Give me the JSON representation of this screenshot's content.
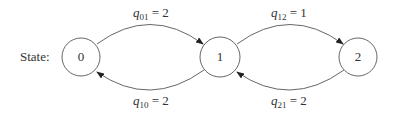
{
  "diagram": {
    "type": "state-transition (Markov chain)",
    "row_label": "State:",
    "states": [
      {
        "id": "0",
        "label": "0"
      },
      {
        "id": "1",
        "label": "1"
      },
      {
        "id": "2",
        "label": "2"
      }
    ],
    "transitions": [
      {
        "from": "0",
        "to": "1",
        "symbol": "q",
        "sub": "01",
        "value": "= 2",
        "position": "top"
      },
      {
        "from": "1",
        "to": "0",
        "symbol": "q",
        "sub": "10",
        "value": "= 2",
        "position": "bottom"
      },
      {
        "from": "1",
        "to": "2",
        "symbol": "q",
        "sub": "12",
        "value": "= 1",
        "position": "top"
      },
      {
        "from": "2",
        "to": "1",
        "symbol": "q",
        "sub": "21",
        "value": "= 2",
        "position": "bottom"
      }
    ],
    "colors": {
      "stroke": "#555555",
      "text": "#333333",
      "background": "#ffffff"
    }
  }
}
